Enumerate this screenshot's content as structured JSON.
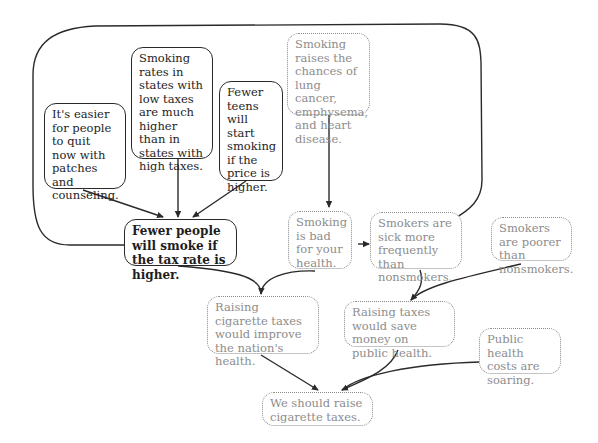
{
  "diagram": {
    "type": "argument-map",
    "nodes": {
      "easier_to_quit": {
        "text": "It's easier for people to quit now with patches and counseling.",
        "style": "solid"
      },
      "smoking_rates_states": {
        "text": "Smoking rates in states with low taxes are much higher than in states with high taxes.",
        "style": "solid"
      },
      "fewer_teens": {
        "text": "Fewer teens will start smoking if the price is higher.",
        "style": "solid"
      },
      "fewer_people_smoke": {
        "text": "Fewer people will smoke if the tax rate is higher.",
        "style": "solid-bold"
      },
      "raises_chances": {
        "text": "Smoking raises the chances of lung cancer, emphysema, and heart disease.",
        "style": "dotted"
      },
      "bad_for_health": {
        "text": "Smoking is bad for your health.",
        "style": "dotted"
      },
      "sick_more": {
        "text": "Smokers are sick more frequently than nonsmokers.",
        "style": "dotted"
      },
      "poorer": {
        "text": "Smokers are poorer than nonsmokers.",
        "style": "dotted"
      },
      "improve_health": {
        "text": "Raising cigarette taxes would improve the nation's health.",
        "style": "dotted"
      },
      "save_money": {
        "text": "Raising taxes would save money on public health.",
        "style": "dotted"
      },
      "costs_soaring": {
        "text": "Public health costs are soaring.",
        "style": "dotted"
      },
      "conclusion": {
        "text": "We should raise cigarette taxes.",
        "style": "dotted"
      }
    },
    "edges": [
      {
        "from": "easier_to_quit",
        "to": "fewer_people_smoke"
      },
      {
        "from": "smoking_rates_states",
        "to": "fewer_people_smoke"
      },
      {
        "from": "fewer_teens",
        "to": "fewer_people_smoke"
      },
      {
        "from": "raises_chances",
        "to": "bad_for_health"
      },
      {
        "from": "bad_for_health",
        "to": "sick_more"
      },
      {
        "from": "fewer_people_smoke",
        "to": "improve_health",
        "joined_with": "bad_for_health"
      },
      {
        "from": "sick_more",
        "to": "save_money",
        "joined_with": [
          "fewer_people_smoke",
          "poorer"
        ]
      },
      {
        "from": "improve_health",
        "to": "conclusion"
      },
      {
        "from": "save_money",
        "to": "conclusion",
        "joined_with": "costs_soaring"
      }
    ],
    "colors": {
      "solid_line": "#2a2a2a",
      "dotted_line": "#8a8a8a",
      "dotted_text": "#8d8d8d",
      "solid_text": "#1e1e1e"
    }
  }
}
